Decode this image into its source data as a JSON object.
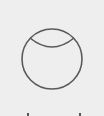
{
  "diagram": {
    "shape": "circle-with-inner-arc",
    "background_color": "#eeeeee",
    "stroke_color": "#5a5a5a",
    "circle": {
      "cx": 52,
      "cy": 59,
      "r": 30
    },
    "arc": {
      "start": [
        30,
        38
      ],
      "control": [
        52,
        56
      ],
      "end": [
        74,
        38
      ]
    }
  },
  "caption": {
    "text": ""
  }
}
